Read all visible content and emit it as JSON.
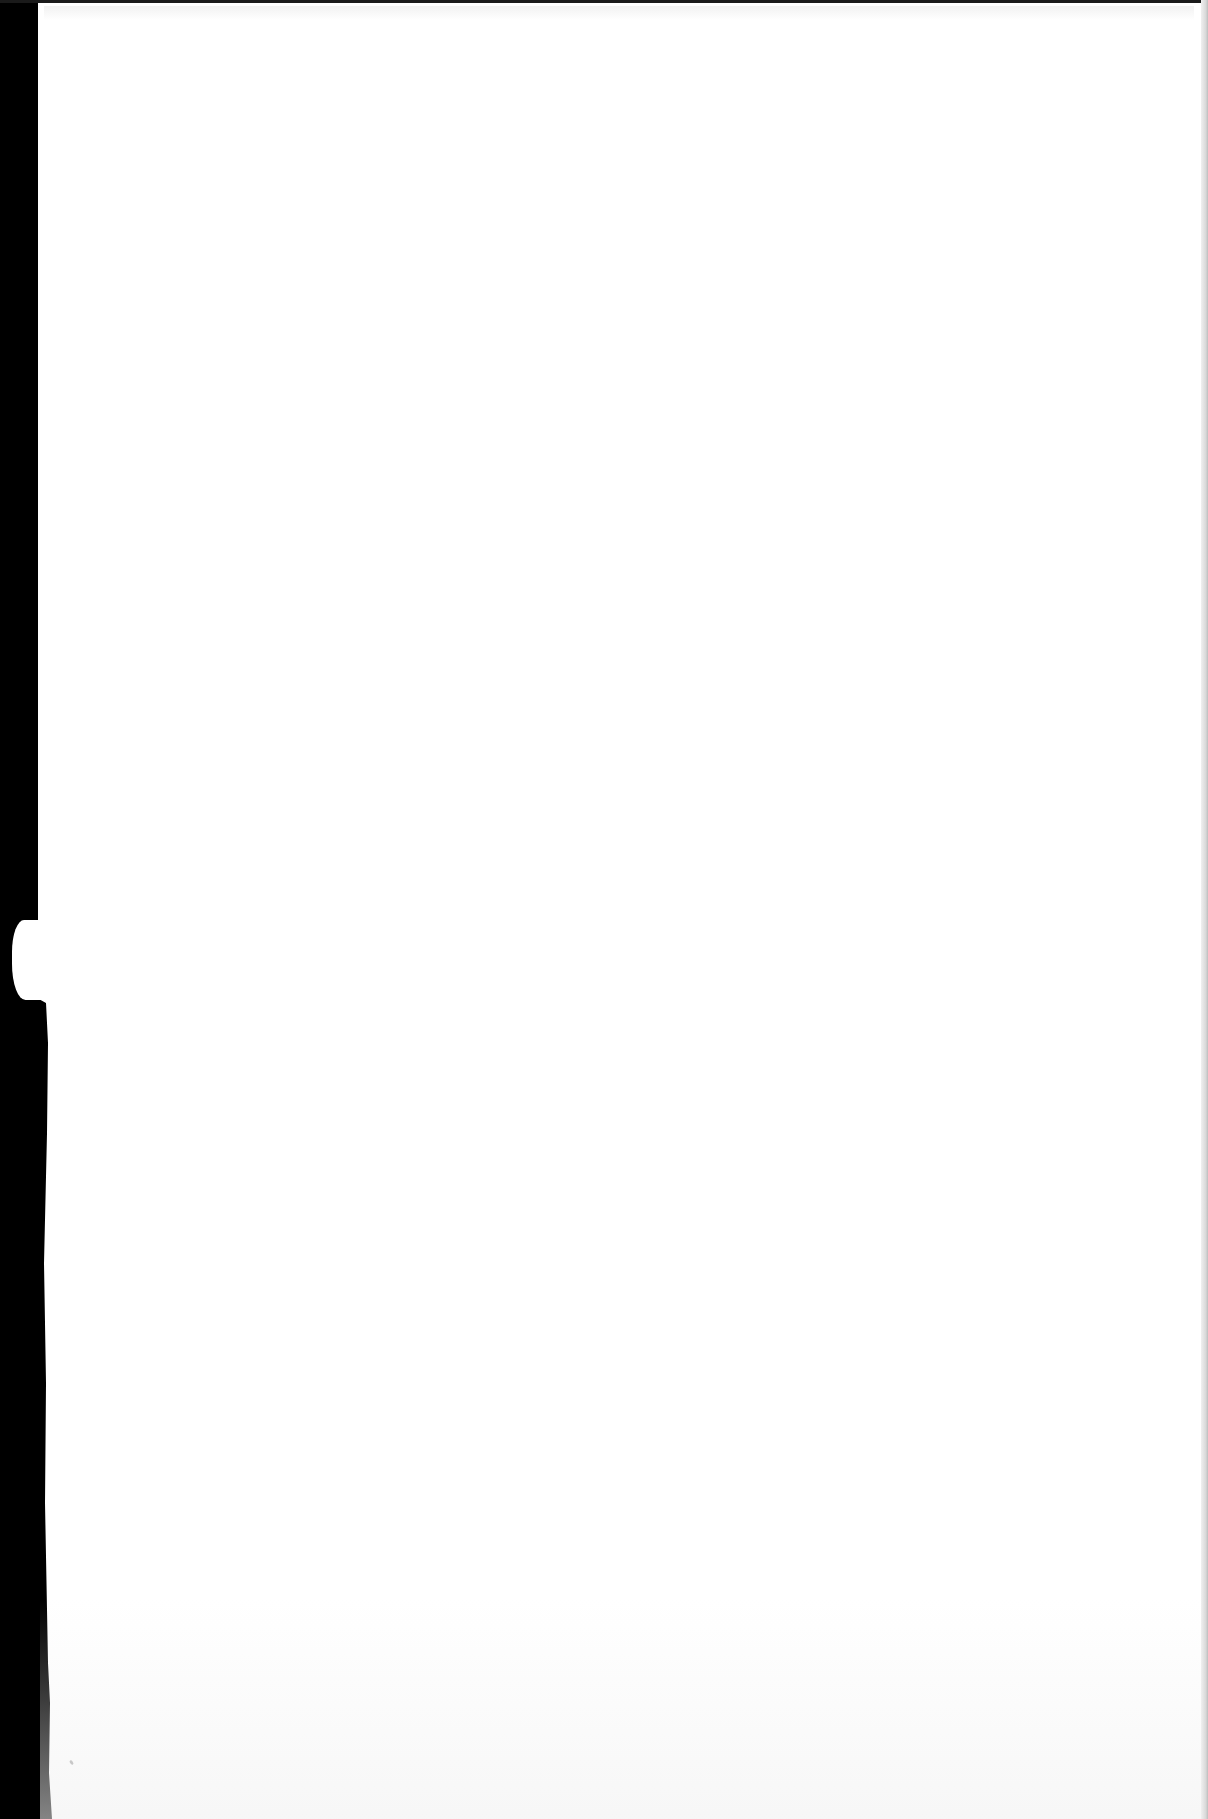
{
  "document": {
    "type": "scanned-page",
    "content": "blank",
    "visible_text": []
  },
  "colors": {
    "paper": "#ffffff",
    "scan_background": "#000000",
    "right_edge_shadow": "#bdbdbd"
  }
}
